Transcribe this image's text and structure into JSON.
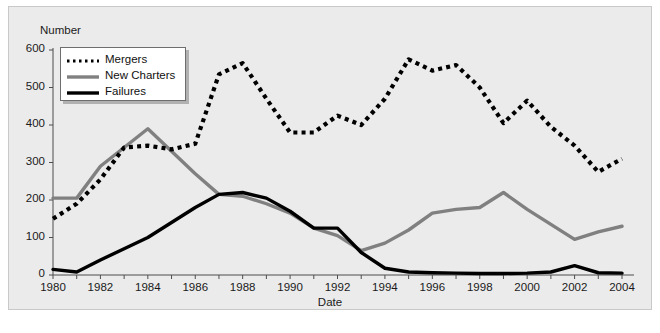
{
  "chart_data": {
    "type": "line",
    "title": "",
    "xlabel": "Date",
    "ylabel": "Number",
    "xlim": [
      1980,
      2004
    ],
    "ylim": [
      0,
      600
    ],
    "grid": false,
    "legend_position": "top-left",
    "x": [
      1980,
      1981,
      1982,
      1983,
      1984,
      1985,
      1986,
      1987,
      1988,
      1989,
      1990,
      1991,
      1992,
      1993,
      1994,
      1995,
      1996,
      1997,
      1998,
      1999,
      2000,
      2001,
      2002,
      2003,
      2004
    ],
    "xticks": [
      "1980",
      "1982",
      "1984",
      "1986",
      "1988",
      "1990",
      "1992",
      "1994",
      "1996",
      "1998",
      "2000",
      "2002",
      "2004"
    ],
    "yticks": [
      "0",
      "100",
      "200",
      "300",
      "400",
      "500",
      "600"
    ],
    "series": [
      {
        "name": "Mergers",
        "style": "dashed",
        "color": "#000000",
        "values": [
          150,
          190,
          255,
          340,
          345,
          335,
          350,
          535,
          565,
          470,
          380,
          380,
          425,
          400,
          470,
          575,
          545,
          560,
          500,
          405,
          465,
          395,
          345,
          275,
          310
        ]
      },
      {
        "name": "New Charters",
        "style": "solid",
        "color": "#808080",
        "values": [
          205,
          205,
          290,
          340,
          390,
          330,
          270,
          215,
          210,
          190,
          165,
          125,
          105,
          65,
          85,
          120,
          165,
          175,
          180,
          220,
          175,
          135,
          95,
          115,
          130
        ]
      },
      {
        "name": "Failures",
        "style": "solid",
        "color": "#000000",
        "values": [
          15,
          8,
          40,
          70,
          100,
          140,
          180,
          215,
          220,
          205,
          170,
          125,
          125,
          60,
          18,
          8,
          6,
          5,
          4,
          4,
          5,
          8,
          25,
          6,
          5
        ]
      }
    ]
  },
  "legend": {
    "items": [
      {
        "label": "Mergers",
        "swatch": "dashed-line-swatch"
      },
      {
        "label": "New Charters",
        "swatch": "gray-line-swatch"
      },
      {
        "label": "Failures",
        "swatch": "black-line-swatch"
      }
    ]
  },
  "axes": {
    "y_title": "Number",
    "x_title": "Date"
  },
  "colors": {
    "panel_background": "#ebebeb",
    "figure_background": "#ffffff",
    "mergers": "#000000",
    "new_charters": "#808080",
    "failures": "#000000",
    "axis": "#4d4d4d"
  }
}
